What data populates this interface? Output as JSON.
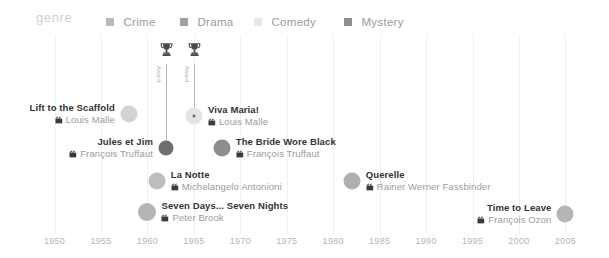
{
  "legend": {
    "title": "genre",
    "items": [
      {
        "label": "Crime",
        "color": "#b9b9b9",
        "x": 106
      },
      {
        "label": "Drama",
        "color": "#a0a0a0",
        "x": 180
      },
      {
        "label": "Comedy",
        "color": "#e6e6e6",
        "x": 254
      },
      {
        "label": "Mystery",
        "color": "#8f8f8f",
        "x": 344
      }
    ]
  },
  "chart_data": {
    "type": "scatter",
    "title": "",
    "xlabel": "",
    "ylabel": "",
    "xlim": [
      1948,
      2007
    ],
    "grid": true,
    "legend_position": "top",
    "xticks": [
      1950,
      1955,
      1960,
      1965,
      1970,
      1975,
      1980,
      1985,
      1990,
      1995,
      2000,
      2005
    ],
    "points": [
      {
        "title": "Lift to the Scaffold",
        "director": "Louis Malle",
        "year": 1958,
        "genre": "Crime",
        "color": "#d3d3d3",
        "size": 17,
        "label_side": "left",
        "award": null
      },
      {
        "title": "Viva Maria!",
        "director": "Louis Malle",
        "year": 1965,
        "genre": "Comedy",
        "color": "#e4e4e4",
        "size": 17,
        "label_side": "right",
        "award": {
          "text": "Award",
          "core": true
        }
      },
      {
        "title": "Jules et Jim",
        "director": "François Truffaut",
        "year": 1962,
        "genre": "Mystery",
        "color": "#6f6f6f",
        "size": 15,
        "label_side": "left",
        "award": {
          "text": "Award",
          "core": true
        }
      },
      {
        "title": "The Bride Wore Black",
        "director": "François Truffaut",
        "year": 1968,
        "genre": "Drama",
        "color": "#8c8c8c",
        "size": 17,
        "label_side": "right",
        "award": null
      },
      {
        "title": "La Notte",
        "director": "Michelangelo Antonioni",
        "year": 1961,
        "genre": "Drama",
        "color": "#bdbdbd",
        "size": 17,
        "label_side": "right",
        "award": null
      },
      {
        "title": "Querelle",
        "director": "Rainer Werner Fassbinder",
        "year": 1982,
        "genre": "Drama",
        "color": "#b0b0b0",
        "size": 17,
        "label_side": "right",
        "award": null
      },
      {
        "title": "Seven Days... Seven Nights",
        "director": "Peter Brook",
        "year": 1960,
        "genre": "Drama",
        "color": "#b5b5b5",
        "size": 18,
        "label_side": "right",
        "award": null
      },
      {
        "title": "Time to Leave",
        "director": "François Ozon",
        "year": 2005,
        "genre": "Drama",
        "color": "#b5b5b5",
        "size": 17,
        "label_side": "left",
        "award": null
      }
    ]
  }
}
